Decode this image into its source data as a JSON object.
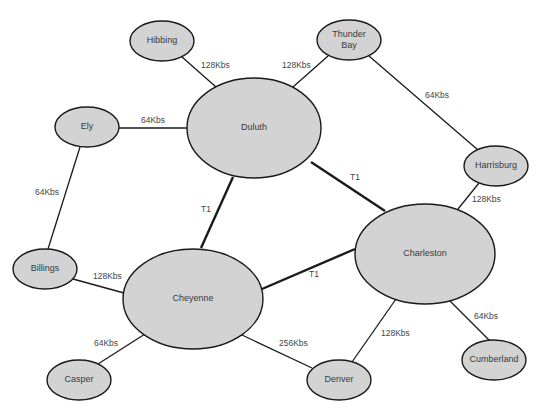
{
  "diagram": {
    "type": "network-topology",
    "colors": {
      "node_fill": "#d3d3d3",
      "node_stroke": "#1a1a1a",
      "edge": "#1a1a1a",
      "text": "#3a3a3a",
      "background": "#ffffff"
    },
    "nodes": [
      {
        "id": "hibbing",
        "label": [
          "Hibbing"
        ],
        "cx": 162,
        "cy": 41,
        "rx": 32,
        "ry": 20
      },
      {
        "id": "thunder-bay",
        "label": [
          "Thunder",
          "Bay"
        ],
        "cx": 349,
        "cy": 40,
        "rx": 32,
        "ry": 20
      },
      {
        "id": "ely",
        "label": [
          "Ely"
        ],
        "cx": 87,
        "cy": 127,
        "rx": 32,
        "ry": 20
      },
      {
        "id": "duluth",
        "label": [
          "Duluth"
        ],
        "cx": 254,
        "cy": 128,
        "rx": 67,
        "ry": 50
      },
      {
        "id": "harrisburg",
        "label": [
          "Harrisburg"
        ],
        "cx": 496,
        "cy": 166,
        "rx": 32,
        "ry": 20
      },
      {
        "id": "charleston",
        "label": [
          "Charleston"
        ],
        "cx": 425,
        "cy": 254,
        "rx": 70,
        "ry": 50
      },
      {
        "id": "billings",
        "label": [
          "Billings"
        ],
        "cx": 45,
        "cy": 269,
        "rx": 32,
        "ry": 20
      },
      {
        "id": "cheyenne",
        "label": [
          "Cheyenne"
        ],
        "cx": 193,
        "cy": 299,
        "rx": 70,
        "ry": 50
      },
      {
        "id": "casper",
        "label": [
          "Casper"
        ],
        "cx": 79,
        "cy": 380,
        "rx": 32,
        "ry": 20
      },
      {
        "id": "denver",
        "label": [
          "Denver"
        ],
        "cx": 339,
        "cy": 380,
        "rx": 32,
        "ry": 20
      },
      {
        "id": "cumberland",
        "label": [
          "Cumberland"
        ],
        "cx": 494,
        "cy": 360,
        "rx": 32,
        "ry": 20
      }
    ],
    "edges": [
      {
        "from": "hibbing",
        "to": "duluth",
        "label": "128Kbs",
        "thick": false,
        "x1": 182,
        "y1": 57,
        "x2": 216,
        "y2": 87,
        "lx": 201,
        "ly": 68
      },
      {
        "from": "thunder-bay",
        "to": "duluth",
        "label": "128Kbs",
        "thick": false,
        "x1": 328,
        "y1": 56,
        "x2": 293,
        "y2": 87,
        "lx": 282,
        "ly": 68
      },
      {
        "from": "ely",
        "to": "duluth",
        "label": "64Kbs",
        "thick": false,
        "x1": 119,
        "y1": 128,
        "x2": 187,
        "y2": 128,
        "lx": 141,
        "ly": 123
      },
      {
        "from": "thunder-bay",
        "to": "harrisburg",
        "label": "64Kbs",
        "thick": false,
        "x1": 369,
        "y1": 56,
        "x2": 478,
        "y2": 150,
        "lx": 425,
        "ly": 98
      },
      {
        "from": "duluth",
        "to": "charleston",
        "label": "T1",
        "thick": true,
        "x1": 311,
        "y1": 162,
        "x2": 385,
        "y2": 211,
        "lx": 350,
        "ly": 180
      },
      {
        "from": "duluth",
        "to": "cheyenne",
        "label": "T1",
        "thick": true,
        "x1": 233,
        "y1": 177,
        "x2": 201,
        "y2": 248,
        "lx": 201,
        "ly": 212
      },
      {
        "from": "ely",
        "to": "billings",
        "label": "64Kbs",
        "thick": false,
        "x1": 80,
        "y1": 147,
        "x2": 48,
        "y2": 249,
        "lx": 35,
        "ly": 195
      },
      {
        "from": "harrisburg",
        "to": "charleston",
        "label": "128Kbs",
        "thick": false,
        "x1": 479,
        "y1": 183,
        "x2": 458,
        "y2": 209,
        "lx": 472,
        "ly": 202
      },
      {
        "from": "cheyenne",
        "to": "charleston",
        "label": "T1",
        "thick": true,
        "x1": 262,
        "y1": 289,
        "x2": 355,
        "y2": 249,
        "lx": 309,
        "ly": 277
      },
      {
        "from": "billings",
        "to": "cheyenne",
        "label": "128Kbs",
        "thick": false,
        "x1": 73,
        "y1": 279,
        "x2": 124,
        "y2": 293,
        "lx": 93,
        "ly": 279
      },
      {
        "from": "cheyenne",
        "to": "casper",
        "label": "64Kbs",
        "thick": false,
        "x1": 145,
        "y1": 334,
        "x2": 98,
        "y2": 364,
        "lx": 94,
        "ly": 346
      },
      {
        "from": "cheyenne",
        "to": "denver",
        "label": "256Kbs",
        "thick": false,
        "x1": 242,
        "y1": 335,
        "x2": 312,
        "y2": 368,
        "lx": 279,
        "ly": 346
      },
      {
        "from": "charleston",
        "to": "denver",
        "label": "128Kbs",
        "thick": false,
        "x1": 396,
        "y1": 299,
        "x2": 352,
        "y2": 362,
        "lx": 381,
        "ly": 336
      },
      {
        "from": "charleston",
        "to": "cumberland",
        "label": "64Kbs",
        "thick": false,
        "x1": 448,
        "y1": 299,
        "x2": 490,
        "y2": 341,
        "lx": 474,
        "ly": 319
      }
    ]
  }
}
